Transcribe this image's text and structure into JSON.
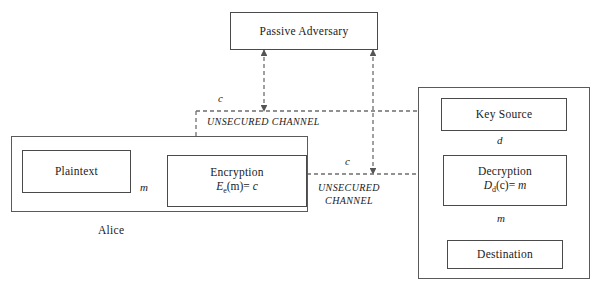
{
  "diagram": {
    "colors": {
      "solid_line": "#4a4a4a",
      "dashed_line": "#6e6e6e",
      "box_border": "#4a4a4a",
      "background": "#ffffff",
      "text": "#1a1a1a"
    },
    "nodes": {
      "passive_adversary": {
        "label": "Passive Adversary"
      },
      "plaintext": {
        "label": "Plaintext"
      },
      "encryption": {
        "label": "Encryption",
        "formula_fn": "E",
        "formula_sub": "e",
        "formula_arg": "(m)=",
        "formula_result": "c"
      },
      "key_source": {
        "label": "Key Source"
      },
      "decryption": {
        "label": "Decryption",
        "formula_fn": "D",
        "formula_sub": "d",
        "formula_arg": "(c)=",
        "formula_result": "m"
      },
      "destination": {
        "label": "Destination"
      }
    },
    "groups": {
      "alice": {
        "caption": "Alice"
      },
      "bob": {
        "caption": ""
      }
    },
    "edge_labels": {
      "plaintext_to_encryption": "m",
      "cipher_tap_left": "c",
      "cipher_main": "c",
      "key_to_decryption": "d",
      "decryption_to_destination": "m"
    },
    "channel_labels": {
      "upper": "UNSECURED CHANNEL",
      "lower_line1": "UNSECURED",
      "lower_line2": "CHANNEL"
    }
  }
}
